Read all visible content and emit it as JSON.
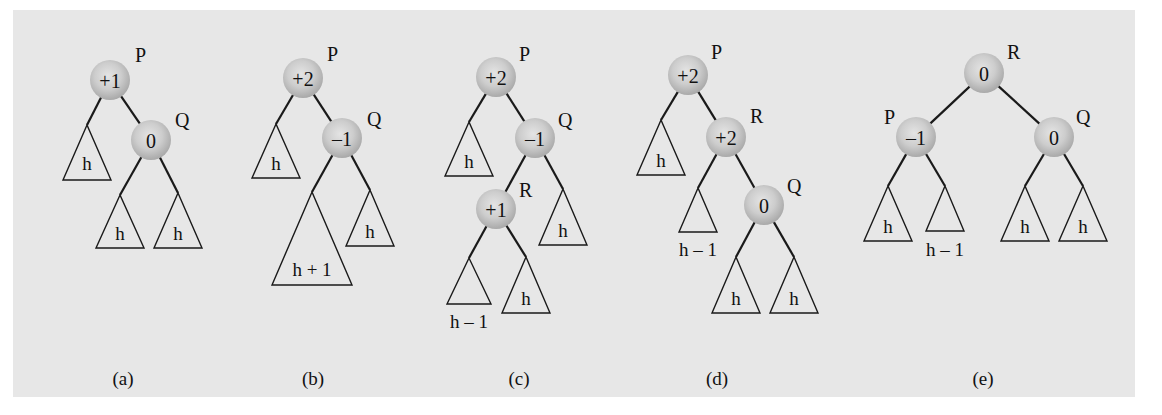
{
  "figure": {
    "background": "#e7e7e7",
    "node_fill": "#c9c9c9",
    "subfigures": [
      {
        "caption": "(a)",
        "nodes": [
          {
            "id": "P",
            "balance": "+1",
            "x": 110,
            "y": 80
          },
          {
            "id": "Q",
            "balance": "0",
            "x": 151,
            "y": 140
          }
        ],
        "edges": [
          [
            "P",
            "Q"
          ]
        ],
        "subtrees": [
          {
            "label": "h",
            "apex": [
              87,
              125
            ],
            "base_y": 180,
            "half": 24,
            "text_y": 170
          },
          {
            "label": "h",
            "apex": [
              120,
              195
            ],
            "base_y": 248,
            "half": 24,
            "text_y": 240
          },
          {
            "label": "h",
            "apex": [
              178,
              193
            ],
            "base_y": 248,
            "half": 24,
            "text_y": 240
          }
        ],
        "subtree_links": [
          [
            "P",
            87,
            125
          ],
          [
            "Q",
            120,
            195
          ],
          [
            "Q",
            178,
            193
          ]
        ],
        "caption_x": 123
      },
      {
        "caption": "(b)",
        "nodes": [
          {
            "id": "P",
            "balance": "+2",
            "x": 303,
            "y": 78
          },
          {
            "id": "Q",
            "balance": "–1",
            "x": 342,
            "y": 138
          }
        ],
        "edges": [
          [
            "P",
            "Q"
          ]
        ],
        "subtrees": [
          {
            "label": "h",
            "apex": [
              276,
              124
            ],
            "base_y": 178,
            "half": 24,
            "text_y": 170
          },
          {
            "label": "h + 1",
            "apex": [
              312,
              192
            ],
            "base_y": 285,
            "half": 40,
            "text_y": 276
          },
          {
            "label": "h",
            "apex": [
              370,
              190
            ],
            "base_y": 246,
            "half": 24,
            "text_y": 238
          }
        ],
        "subtree_links": [
          [
            "P",
            276,
            124
          ],
          [
            "Q",
            312,
            192
          ],
          [
            "Q",
            370,
            190
          ]
        ],
        "caption_x": 313
      },
      {
        "caption": "(c)",
        "nodes": [
          {
            "id": "P",
            "balance": "+2",
            "x": 496,
            "y": 77
          },
          {
            "id": "Q",
            "balance": "–1",
            "x": 535,
            "y": 138
          },
          {
            "id": "R",
            "balance": "+1",
            "x": 496,
            "y": 209
          }
        ],
        "edges": [
          [
            "P",
            "Q"
          ],
          [
            "Q",
            "R"
          ]
        ],
        "subtrees": [
          {
            "label": "h",
            "apex": [
              469,
              122
            ],
            "base_y": 176,
            "half": 24,
            "text_y": 168
          },
          {
            "label": "h",
            "apex": [
              563,
              189
            ],
            "base_y": 245,
            "half": 24,
            "text_y": 237
          },
          {
            "label": "h – 1",
            "apex": [
              469,
              258
            ],
            "base_y": 304,
            "half": 22,
            "text_y": 328
          },
          {
            "label": "h",
            "apex": [
              526,
              257
            ],
            "base_y": 313,
            "half": 24,
            "text_y": 305
          }
        ],
        "subtree_links": [
          [
            "P",
            469,
            122
          ],
          [
            "Q",
            563,
            189
          ],
          [
            "R",
            469,
            258
          ],
          [
            "R",
            526,
            257
          ]
        ],
        "caption_x": 519
      },
      {
        "caption": "(d)",
        "nodes": [
          {
            "id": "P",
            "balance": "+2",
            "x": 688,
            "y": 75
          },
          {
            "id": "R",
            "balance": "+2",
            "x": 726,
            "y": 137
          },
          {
            "id": "Q",
            "balance": "0",
            "x": 764,
            "y": 205
          }
        ],
        "edges": [
          [
            "P",
            "R"
          ],
          [
            "R",
            "Q"
          ]
        ],
        "subtrees": [
          {
            "label": "h",
            "apex": [
              661,
              120
            ],
            "base_y": 175,
            "half": 24,
            "text_y": 167
          },
          {
            "label": "h – 1",
            "apex": [
              698,
              188
            ],
            "base_y": 232,
            "half": 19,
            "text_y": 256
          },
          {
            "label": "h",
            "apex": [
              736,
              257
            ],
            "base_y": 313,
            "half": 24,
            "text_y": 305
          },
          {
            "label": "h",
            "apex": [
              794,
              257
            ],
            "base_y": 313,
            "half": 24,
            "text_y": 305
          }
        ],
        "subtree_links": [
          [
            "P",
            661,
            120
          ],
          [
            "R",
            698,
            188
          ],
          [
            "Q",
            736,
            257
          ],
          [
            "Q",
            794,
            257
          ]
        ],
        "caption_x": 717
      },
      {
        "caption": "(e)",
        "nodes": [
          {
            "id": "R",
            "balance": "0",
            "x": 984,
            "y": 73
          },
          {
            "id": "P",
            "balance": "–1",
            "x": 916,
            "y": 137
          },
          {
            "id": "Q",
            "balance": "0",
            "x": 1054,
            "y": 137
          }
        ],
        "edges": [
          [
            "R",
            "P"
          ],
          [
            "R",
            "Q"
          ]
        ],
        "subtrees": [
          {
            "label": "h",
            "apex": [
              888,
              186
            ],
            "base_y": 241,
            "half": 24,
            "text_y": 233
          },
          {
            "label": "h – 1",
            "apex": [
              945,
              186
            ],
            "base_y": 231,
            "half": 19,
            "text_y": 256
          },
          {
            "label": "h",
            "apex": [
              1025,
              186
            ],
            "base_y": 241,
            "half": 24,
            "text_y": 233
          },
          {
            "label": "h",
            "apex": [
              1083,
              186
            ],
            "base_y": 241,
            "half": 24,
            "text_y": 233
          }
        ],
        "subtree_links": [
          [
            "P",
            888,
            186
          ],
          [
            "P",
            945,
            186
          ],
          [
            "Q",
            1025,
            186
          ],
          [
            "Q",
            1083,
            186
          ]
        ],
        "caption_x": 983
      }
    ],
    "node_labels": {
      "a": [
        {
          "text": "P",
          "x": 135,
          "y": 62
        },
        {
          "text": "Q",
          "x": 175,
          "y": 127
        }
      ],
      "b": [
        {
          "text": "P",
          "x": 327,
          "y": 61
        },
        {
          "text": "Q",
          "x": 367,
          "y": 126
        }
      ],
      "c": [
        {
          "text": "P",
          "x": 519,
          "y": 61
        },
        {
          "text": "Q",
          "x": 558,
          "y": 127
        },
        {
          "text": "R",
          "x": 519,
          "y": 197
        }
      ],
      "d": [
        {
          "text": "P",
          "x": 711,
          "y": 59
        },
        {
          "text": "R",
          "x": 750,
          "y": 123
        },
        {
          "text": "Q",
          "x": 787,
          "y": 193
        }
      ],
      "e": [
        {
          "text": "R",
          "x": 1007,
          "y": 59
        },
        {
          "text": "P",
          "x": 884,
          "y": 124
        },
        {
          "text": "Q",
          "x": 1076,
          "y": 124
        }
      ]
    },
    "caption_y": 385
  }
}
